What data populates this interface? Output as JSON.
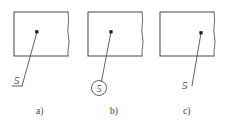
{
  "figure": {
    "background_color": "#ffffff",
    "line_color": "#4a4a4a",
    "text_color": "#3a3a3a",
    "panels": [
      {
        "id": "a",
        "caption": "a)",
        "value_label": "5",
        "terminator": "shelf",
        "dot_label": "reference-point",
        "rect": {
          "x": 14,
          "y": 12,
          "width": 54,
          "height": 44
        },
        "dot": {
          "x": 37,
          "y": 32
        },
        "leader_path": "M 37 32 L 22 86",
        "shelf_path": "M 22 86 L 12 86",
        "value_pos": {
          "x": 14,
          "y": 84
        },
        "caption_pos": {
          "x": 36,
          "y": 114
        }
      },
      {
        "id": "b",
        "caption": "b)",
        "value_label": "5",
        "terminator": "balloon",
        "dot_label": "reference-point",
        "rect": {
          "x": 88,
          "y": 12,
          "width": 54,
          "height": 44
        },
        "dot": {
          "x": 111,
          "y": 32
        },
        "leader_path": "M 111 32 L 101 81",
        "balloon": {
          "cx": 99,
          "cy": 88,
          "r": 7.5
        },
        "caption_pos": {
          "x": 110,
          "y": 114
        }
      },
      {
        "id": "c",
        "caption": "c)",
        "value_label": "5",
        "terminator": "plain",
        "dot_label": "reference-point",
        "rect": {
          "x": 160,
          "y": 12,
          "width": 54,
          "height": 44
        },
        "dot": {
          "x": 201,
          "y": 33
        },
        "leader_path": "M 201 33 L 192 86",
        "value_pos": {
          "x": 182,
          "y": 89
        },
        "caption_pos": {
          "x": 183,
          "y": 114
        }
      }
    ]
  }
}
